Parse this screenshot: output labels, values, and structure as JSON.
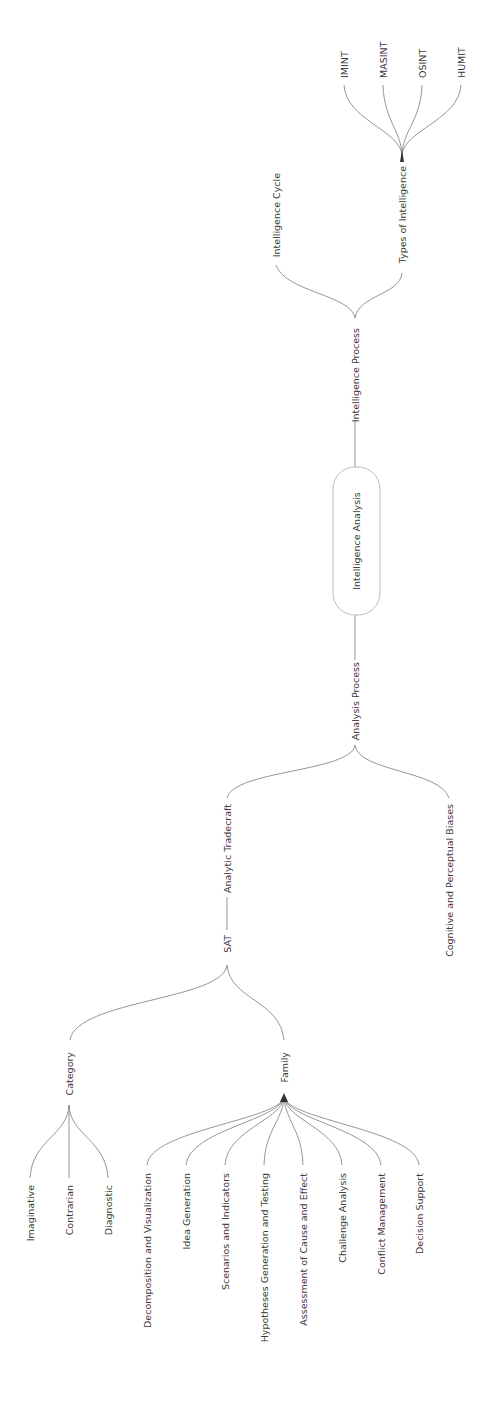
{
  "diagram": {
    "type": "mind-map",
    "orientation": "rotated-90-ccw",
    "root": {
      "label": "Intelligence Analysis"
    },
    "nodes": {
      "intelligence_process": "Intelligence Process",
      "intelligence_cycle": "Intelligence Cycle",
      "types_of_intelligence": "Types of Intelligence",
      "imint": "IMINT",
      "masint": "MASINT",
      "osint": "OSINT",
      "humit": "HUMIT",
      "analysis_process": "Analysis Process",
      "analytic_tradecraft": "Analytic Tradecraft",
      "cognitive_biases": "Cognitive and Perceptual Biases",
      "sat": "SAT",
      "category": "Category",
      "imaginative": "Imaginative",
      "contrarian": "Contrarian",
      "diagnostic": "Diagnostic",
      "family": "Family",
      "decomposition": "Decomposition and Visualization",
      "idea_generation": "Idea Generation",
      "scenarios": "Scenarios and Indicators",
      "hypotheses": "Hypotheses Generation and Testing",
      "cause_effect": "Assessment of Cause and Effect",
      "challenge": "Challenge Analysis",
      "conflict": "Conflict Management",
      "decision": "Decision Support"
    },
    "tree": {
      "label": "Intelligence Analysis",
      "children": [
        {
          "label": "Intelligence Process",
          "children": [
            {
              "label": "Intelligence Cycle"
            },
            {
              "label": "Types of Intelligence",
              "children": [
                {
                  "label": "IMINT"
                },
                {
                  "label": "MASINT"
                },
                {
                  "label": "OSINT"
                },
                {
                  "label": "HUMIT"
                }
              ]
            }
          ]
        },
        {
          "label": "Analysis Process",
          "children": [
            {
              "label": "Analytic Tradecraft",
              "children": [
                {
                  "label": "SAT",
                  "children": [
                    {
                      "label": "Category",
                      "children": [
                        {
                          "label": "Imaginative"
                        },
                        {
                          "label": "Contrarian"
                        },
                        {
                          "label": "Diagnostic"
                        }
                      ]
                    },
                    {
                      "label": "Family",
                      "children": [
                        {
                          "label": "Decomposition and Visualization"
                        },
                        {
                          "label": "Idea Generation"
                        },
                        {
                          "label": "Scenarios and Indicators"
                        },
                        {
                          "label": "Hypotheses Generation and Testing"
                        },
                        {
                          "label": "Assessment of Cause and Effect"
                        },
                        {
                          "label": "Challenge Analysis"
                        },
                        {
                          "label": "Conflict Management"
                        },
                        {
                          "label": "Decision Support"
                        }
                      ]
                    }
                  ]
                }
              ]
            },
            {
              "label": "Cognitive and Perceptual Biases"
            }
          ]
        }
      ]
    },
    "colors": {
      "edge": "#8a8a8a",
      "text": "#3a3a3a",
      "root_border": "#b5b5b5",
      "background": "#ffffff"
    }
  }
}
